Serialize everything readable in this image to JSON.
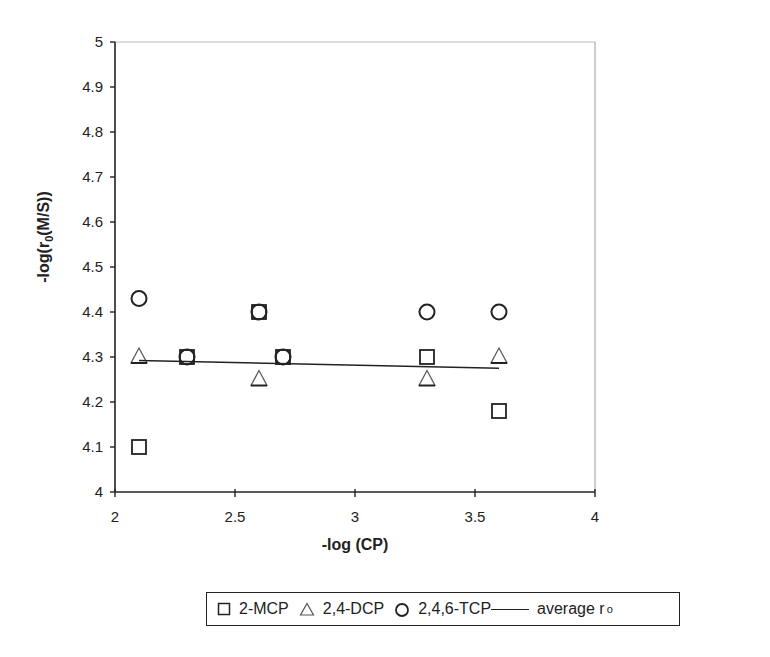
{
  "chart_data": {
    "type": "scatter",
    "title": "",
    "xlabel": "-log (CP)",
    "ylabel": "-log(r0(M/S))",
    "xlim": [
      2,
      4
    ],
    "ylim": [
      4,
      5
    ],
    "x_ticks": [
      "2",
      "2.5",
      "3",
      "3.5",
      "4"
    ],
    "y_ticks": [
      "4",
      "4.1",
      "4.2",
      "4.3",
      "4.4",
      "4.5",
      "4.6",
      "4.7",
      "4.8",
      "4.9",
      "5"
    ],
    "grid": false,
    "legend_position": "bottom",
    "series": [
      {
        "name": "2-MCP",
        "marker": "square",
        "x": [
          2.1,
          2.3,
          2.6,
          2.7,
          3.3,
          3.6
        ],
        "y": [
          4.1,
          4.3,
          4.4,
          4.3,
          4.3,
          4.18
        ]
      },
      {
        "name": "2,4-DCP",
        "marker": "triangle",
        "x": [
          2.1,
          2.6,
          3.3,
          3.6
        ],
        "y": [
          4.3,
          4.25,
          4.25,
          4.3
        ]
      },
      {
        "name": "2,4,6-TCP",
        "marker": "circle",
        "x": [
          2.1,
          2.3,
          2.6,
          2.7,
          3.3,
          3.6
        ],
        "y": [
          4.43,
          4.3,
          4.4,
          4.3,
          4.4,
          4.4
        ]
      },
      {
        "name": "average r0",
        "marker": "line",
        "x": [
          2.1,
          3.6
        ],
        "y": [
          4.292,
          4.275
        ]
      }
    ]
  },
  "legend": {
    "items": [
      "2-MCP",
      "2,4-DCP",
      "2,4,6-TCP",
      "average r"
    ],
    "subscript": "o"
  }
}
